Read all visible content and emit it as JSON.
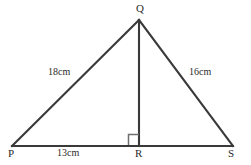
{
  "figure": {
    "kind": "geometry-diagram",
    "shape": "triangle",
    "background_color": "#ffffff",
    "stroke_color": "#3a3a3a",
    "text_color": "#2b2b2b"
  },
  "vertices": [
    {
      "name": "P",
      "label": "P",
      "x": 12,
      "y": 146
    },
    {
      "name": "Q",
      "label": "Q",
      "x": 139,
      "y": 20
    },
    {
      "name": "R",
      "label": "R",
      "x": 139,
      "y": 146
    },
    {
      "name": "S",
      "label": "S",
      "x": 233,
      "y": 146
    }
  ],
  "segments": [
    {
      "name": "base-PS",
      "from": "P",
      "to": "S"
    },
    {
      "name": "side-PQ",
      "from": "P",
      "to": "Q"
    },
    {
      "name": "side-QS",
      "from": "Q",
      "to": "S"
    },
    {
      "name": "altitude-QR",
      "from": "Q",
      "to": "R"
    }
  ],
  "measurements": {
    "side_pq": "18cm",
    "side_qs": "16cm",
    "side_pr": "13cm"
  },
  "right_angle": {
    "at_vertex": "R",
    "marker": "square",
    "size": 10,
    "opens_toward": "left"
  }
}
